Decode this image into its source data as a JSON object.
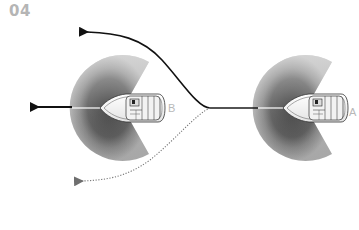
{
  "figure": {
    "number": "04",
    "boats": [
      {
        "id": "A",
        "label": "A"
      },
      {
        "id": "B",
        "label": "B"
      }
    ],
    "paths": [
      {
        "name": "straight-ahead",
        "style": "solid"
      },
      {
        "name": "turn-starboard",
        "style": "solid"
      },
      {
        "name": "turn-port",
        "style": "dotted"
      }
    ],
    "colors": {
      "title": "#b5b5b5",
      "path": "#1a1a1a",
      "dotted_path": "#888888",
      "sector_outer": "#a8a8a8",
      "sector_mid": "#8a8a8a",
      "sector_inner": "#4a4a4a",
      "label": "#b8b8b8"
    }
  }
}
